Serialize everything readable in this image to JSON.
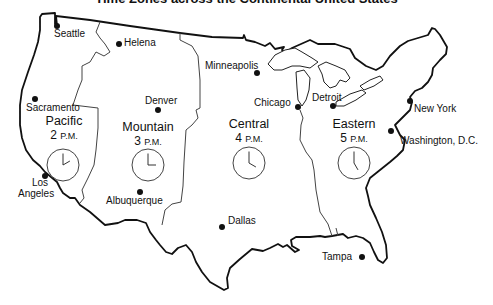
{
  "title": "Time Zones across the Continental United States",
  "colors": {
    "outline": "#111111",
    "zone_border": "#444444",
    "background": "#ffffff"
  },
  "zones": [
    {
      "name": "Pacific",
      "hour": "2",
      "suffix": "P.M.",
      "clock": {
        "cx": 63,
        "cy": 165,
        "r": 16,
        "hour_hand_deg": 60,
        "minute_hand_deg": 0
      }
    },
    {
      "name": "Mountain",
      "hour": "3",
      "suffix": "P.M.",
      "clock": {
        "cx": 148,
        "cy": 165,
        "r": 16,
        "hour_hand_deg": 90,
        "minute_hand_deg": 0
      }
    },
    {
      "name": "Central",
      "hour": "4",
      "suffix": "P.M.",
      "clock": {
        "cx": 249,
        "cy": 163,
        "r": 16,
        "hour_hand_deg": 120,
        "minute_hand_deg": 0
      }
    },
    {
      "name": "Eastern",
      "hour": "5",
      "suffix": "P.M.",
      "clock": {
        "cx": 354,
        "cy": 163,
        "r": 16,
        "hour_hand_deg": 150,
        "minute_hand_deg": 0
      }
    }
  ],
  "cities": [
    {
      "name": "Seattle",
      "x": 57,
      "y": 26
    },
    {
      "name": "Helena",
      "x": 119,
      "y": 44
    },
    {
      "name": "Sacramento",
      "x": 35,
      "y": 99
    },
    {
      "name": "Denver",
      "x": 158,
      "y": 110
    },
    {
      "name": "Los Angeles",
      "x": 45,
      "y": 176
    },
    {
      "name": "Albuquerque",
      "x": 140,
      "y": 192
    },
    {
      "name": "Minneapolis",
      "x": 257,
      "y": 73
    },
    {
      "name": "Chicago",
      "x": 298,
      "y": 107
    },
    {
      "name": "Detroit",
      "x": 333,
      "y": 106
    },
    {
      "name": "New York",
      "x": 410,
      "y": 101
    },
    {
      "name": "Washington, D.C.",
      "x": 391,
      "y": 131
    },
    {
      "name": "Dallas",
      "x": 222,
      "y": 227
    },
    {
      "name": "Tampa",
      "x": 362,
      "y": 257
    }
  ]
}
